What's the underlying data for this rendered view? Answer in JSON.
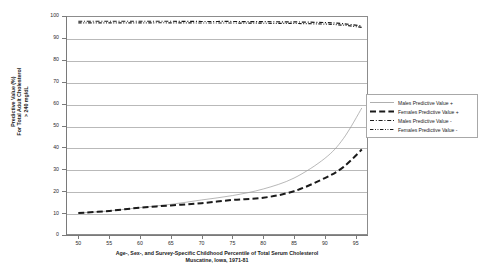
{
  "chart_data": {
    "type": "line",
    "title": "",
    "subtitle": "",
    "xlabel": "Age-, Sex-, and Survey-Specific Childhood Percentile of Total Serum Cholesterol",
    "xlabel_line2": "Muscatine, Iowa, 1971-81",
    "ylabel": "Predictive Value (%)",
    "ylabel_line2": "For Total Adult Cholesterol",
    "ylabel_line3": "> 240 mg/dL",
    "xlim": [
      48,
      97
    ],
    "ylim": [
      0,
      100
    ],
    "grid": true,
    "legend_position": "right",
    "xticks": [
      50,
      55,
      60,
      65,
      70,
      75,
      80,
      85,
      90,
      95
    ],
    "yticks": [
      0,
      10,
      20,
      30,
      40,
      50,
      60,
      70,
      80,
      90,
      100
    ],
    "x": [
      50,
      55,
      60,
      65,
      70,
      75,
      80,
      85,
      90,
      93,
      96
    ],
    "series": [
      {
        "name": "Males Predictive Value +",
        "style": "solid",
        "color": "#9a9a9a",
        "width": 0.7,
        "values": [
          10,
          11,
          12.5,
          14,
          16,
          18,
          21,
          26,
          35,
          44,
          58
        ]
      },
      {
        "name": "Females Predictive Value +",
        "style": "dashed",
        "color": "#1a1a1a",
        "width": 2.0,
        "values": [
          10,
          11,
          12.5,
          13.5,
          14.5,
          16,
          17,
          20,
          26,
          31,
          39
        ]
      },
      {
        "name": "Males Predictive Value -",
        "style": "dashdot",
        "color": "#1a1a1a",
        "width": 1.2,
        "values": [
          97.6,
          97.6,
          97.6,
          97.6,
          97.5,
          97.5,
          97.4,
          97.3,
          97.0,
          96.5,
          95.4
        ]
      },
      {
        "name": "Females Predictive Value -",
        "style": "dotted",
        "color": "#1a1a1a",
        "width": 1.2,
        "values": [
          96.9,
          96.9,
          96.9,
          96.9,
          96.8,
          96.8,
          96.7,
          96.6,
          96.3,
          95.8,
          94.8
        ]
      }
    ]
  },
  "legend": {
    "items": [
      {
        "label": "Males Predictive Value +"
      },
      {
        "label": "Females Predictive Value +"
      },
      {
        "label": "Males Predictive Value -"
      },
      {
        "label": "Females Predictive Value -"
      }
    ]
  },
  "axes": {
    "y_tick_labels": [
      "100",
      "90",
      "80",
      "70",
      "60",
      "50",
      "40",
      "30",
      "20",
      "10",
      "0"
    ],
    "x_tick_labels": [
      "50",
      "55",
      "60",
      "65",
      "70",
      "75",
      "80",
      "85",
      "90",
      "95"
    ]
  }
}
